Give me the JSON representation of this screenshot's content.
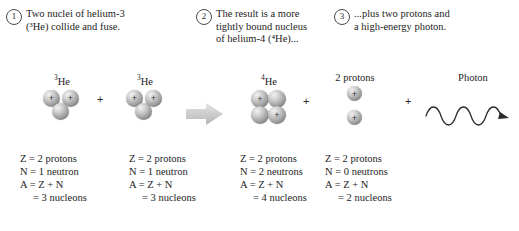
{
  "figure": {
    "background": "#ffffff",
    "nucleon_color": "#9e9e9e",
    "arrow_color": "#c8c8c8",
    "text_color": "#1d1d1d"
  },
  "callouts": [
    {
      "number": "1",
      "text": "Two nuclei of helium-3\n(³He) collide and fuse."
    },
    {
      "number": "2",
      "text": "The result is a more\ntightly bound nucleus\nof helium-4 (⁴He)..."
    },
    {
      "number": "3",
      "text": "...plus two protons and\na high-energy photon."
    }
  ],
  "reaction": {
    "separator_plus": "+",
    "arrow_icon": "block-arrow-right",
    "groups": [
      {
        "id": "helium-3-left",
        "label": "³He",
        "label_base": "He",
        "label_superscript": "3",
        "protons": 2,
        "neutrons": 1,
        "proton_symbol": "+"
      },
      {
        "id": "helium-3-right",
        "label": "³He",
        "label_base": "He",
        "label_superscript": "3",
        "protons": 2,
        "neutrons": 1,
        "proton_symbol": "+"
      },
      {
        "id": "helium-4",
        "label": "⁴He",
        "label_base": "He",
        "label_superscript": "4",
        "protons": 2,
        "neutrons": 2,
        "proton_symbol": "+"
      },
      {
        "id": "two-protons",
        "label": "2 protons",
        "protons": 2,
        "neutrons": 0,
        "proton_symbol": "+"
      },
      {
        "id": "photon",
        "label": "Photon",
        "icon": "sine-wave-arrow",
        "wave_cycles": 4
      }
    ]
  },
  "stats": [
    {
      "id": "stats-helium-3-left",
      "lines": [
        "Z = 2 protons",
        "N = 1 neutron",
        "A = Z + N",
        "= 3 nucleons"
      ]
    },
    {
      "id": "stats-helium-3-right",
      "lines": [
        "Z = 2 protons",
        "N = 1 neutron",
        "A = Z + N",
        "= 3 nucleons"
      ]
    },
    {
      "id": "stats-helium-4",
      "lines": [
        "Z = 2 protons",
        "N = 2 neutrons",
        "A = Z + N",
        "= 4 nucleons"
      ]
    },
    {
      "id": "stats-two-protons",
      "lines": [
        "Z = 2 protons",
        "N = 0 neutrons",
        "A = Z + N",
        "= 2 nucleons"
      ]
    }
  ]
}
